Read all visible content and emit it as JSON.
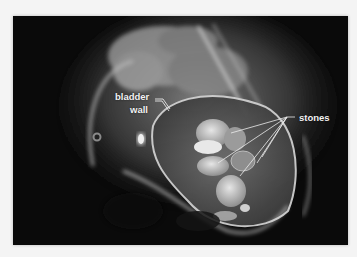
{
  "figure": {
    "type": "radiograph",
    "annotations": {
      "bladder_label_line1": "bladder",
      "bladder_label_line2": "wall",
      "stones_label": "stones"
    },
    "stones_leader_count": 5,
    "colors": {
      "background": "#f4f4f4",
      "film": "#0a0a0a",
      "label": "#f2f2f2"
    }
  }
}
